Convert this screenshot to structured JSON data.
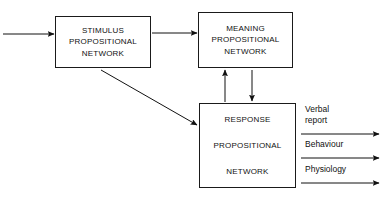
{
  "diagram": {
    "background_color": "#ffffff",
    "line_color": "#1a1a1a",
    "nodes": [
      {
        "id": "stimulus",
        "lines": [
          "STIMULUS",
          "PROPOSITIONAL",
          "NETWORK"
        ],
        "line1": "STIMULUS",
        "line2": "PROPOSITIONAL",
        "line3": "NETWORK"
      },
      {
        "id": "meaning",
        "lines": [
          "MEANING",
          "PROPOSITIONAL",
          "NETWORK"
        ],
        "line1": "MEANING",
        "line2": "PROPOSITIONAL",
        "line3": "NETWORK"
      },
      {
        "id": "response",
        "lines": [
          "RESPONSE",
          "PROPOSITIONAL",
          "NETWORK"
        ],
        "line1": "RESPONSE",
        "line2": "PROPOSITIONAL",
        "line3": "NETWORK"
      }
    ],
    "output_labels": {
      "verbal_report_line1": "Verbal",
      "verbal_report_line2": "report",
      "behaviour": "Behaviour",
      "physiology": "Physiology"
    },
    "edges": [
      {
        "id": "input-to-stimulus",
        "from": "input",
        "to": "stimulus",
        "style": "arrow"
      },
      {
        "id": "stimulus-to-meaning",
        "from": "stimulus",
        "to": "meaning",
        "style": "arrow"
      },
      {
        "id": "stimulus-to-response",
        "from": "stimulus",
        "to": "response",
        "style": "diagonal-arrow"
      },
      {
        "id": "response-to-meaning",
        "from": "response",
        "to": "meaning",
        "style": "arrow-up"
      },
      {
        "id": "meaning-to-response",
        "from": "meaning",
        "to": "response",
        "style": "arrow-down"
      },
      {
        "id": "response-to-verbal-report",
        "from": "response",
        "to": "verbal report",
        "style": "arrow"
      },
      {
        "id": "response-to-behaviour",
        "from": "response",
        "to": "behaviour",
        "style": "arrow"
      },
      {
        "id": "response-to-physiology",
        "from": "response",
        "to": "physiology",
        "style": "arrow"
      }
    ]
  }
}
